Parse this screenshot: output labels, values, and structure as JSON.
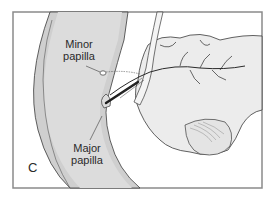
{
  "figure": {
    "panel_letter": "C",
    "labels": {
      "minor_papilla": {
        "line1": "Minor",
        "line2": "papilla"
      },
      "major_papilla": {
        "line1": "Major",
        "line2": "papilla"
      }
    },
    "colors": {
      "frame": "#8a8a8a",
      "duodenum_fill": "#cfcfcf",
      "duodenum_lumen": "#e2e2e2",
      "pancreas_fill": "#ececec",
      "outline": "#3a3a3a",
      "duct": "#2b2b2b",
      "background": "#ffffff"
    },
    "structures": [
      "duodenal wall",
      "minor papilla",
      "major papilla",
      "pancreatic duct",
      "accessory duct",
      "pancreas"
    ]
  }
}
